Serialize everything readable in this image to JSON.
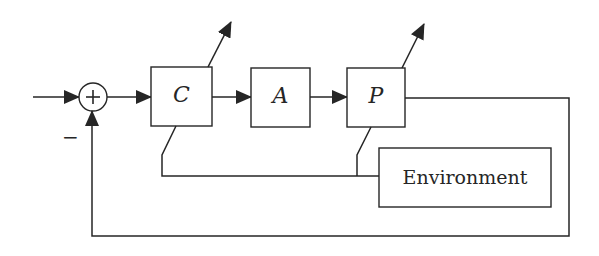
{
  "diagram": {
    "type": "block-diagram",
    "title": "",
    "summing_junction": {
      "symbol": "+",
      "feedback_sign": "−"
    },
    "blocks": [
      {
        "id": "C",
        "label": "C",
        "adaptive": true
      },
      {
        "id": "A",
        "label": "A",
        "adaptive": false
      },
      {
        "id": "P",
        "label": "P",
        "adaptive": true
      },
      {
        "id": "Environment",
        "label": "Environment"
      }
    ],
    "connections": [
      {
        "from": "input",
        "to": "summing_junction"
      },
      {
        "from": "summing_junction",
        "to": "C"
      },
      {
        "from": "C",
        "to": "A"
      },
      {
        "from": "A",
        "to": "P"
      },
      {
        "from": "P",
        "to": "summing_junction",
        "type": "negative-feedback"
      },
      {
        "from": "Environment",
        "to": "C",
        "type": "influence"
      },
      {
        "from": "Environment",
        "to": "P",
        "type": "influence"
      }
    ]
  },
  "colors": {
    "stroke": "#262626",
    "background": "#ffffff"
  }
}
